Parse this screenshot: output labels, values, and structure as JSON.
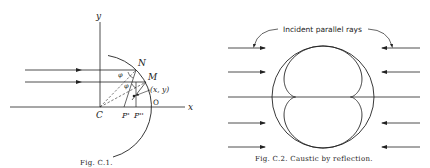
{
  "figures": [
    {
      "id": "fig-c1",
      "caption": "Fig. C.1.",
      "labels": {
        "y_axis": "y",
        "x_axis": "x",
        "center": "C",
        "point_n": "N",
        "point_m": "M",
        "point_coord": "(x, y)",
        "origin": "O",
        "foot_p1": "P'",
        "foot_p2": "P''",
        "angle1": "φ",
        "angle2": "φ"
      }
    },
    {
      "id": "fig-c2",
      "caption": "Fig. C.2. Caustic by reflection.",
      "annotation": "Incident parallel rays"
    }
  ],
  "colors": {
    "ink": "#222222",
    "background": "#ffffff"
  }
}
